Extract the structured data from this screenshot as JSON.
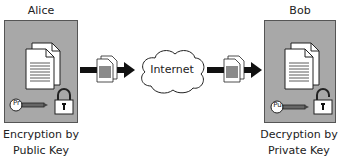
{
  "diagram": {
    "sender": {
      "name": "Alice",
      "caption_line1": "Encryption by",
      "caption_line2": "Public Key",
      "key_label": "Pr",
      "lock_state": "locked"
    },
    "receiver": {
      "name": "Bob",
      "caption_line1": "Decryption by",
      "caption_line2": "Private Key",
      "key_label": "Pu",
      "lock_state": "unlocked"
    },
    "network": {
      "label": "Internet"
    },
    "colors": {
      "panel": "#a8a8a8",
      "panel_border": "#555555",
      "arrow": "#111111",
      "encrypted_fill": "#8a8a8a"
    }
  }
}
